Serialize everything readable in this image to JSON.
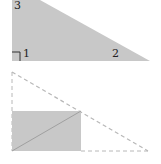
{
  "figure": {
    "top_triangle": {
      "fill": "#c8c8c8",
      "labels": {
        "angle_3": "3",
        "angle_1": "1",
        "angle_2": "2"
      }
    },
    "bottom_figure": {
      "dashed_color": "#b8b8b8",
      "rect_fill": "#c8c8c8",
      "diagonal_color": "#a0a0a0"
    }
  }
}
